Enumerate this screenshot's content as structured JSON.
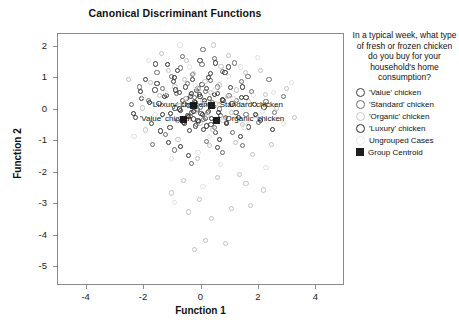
{
  "chart_data": {
    "type": "scatter",
    "title": "Canonical Discriminant Functions",
    "xlabel": "Function 1",
    "ylabel": "Function 2",
    "xlim": [
      -5.0,
      5.0
    ],
    "ylim": [
      -5.6,
      2.4
    ],
    "xticks": [
      -4,
      -2,
      0,
      2,
      4
    ],
    "yticks": [
      2,
      1,
      0,
      -1,
      -2,
      -3,
      -4,
      -5
    ],
    "xtick_labels": [
      "-4",
      "-2",
      "0",
      "2",
      "4"
    ],
    "ytick_labels": [
      "2",
      "1",
      "0",
      "-1",
      "-2",
      "-3",
      "-4",
      "-5"
    ],
    "grid": false,
    "legend_position": "right",
    "legend_title": "In a typical week, what type of fresh or frozen chicken do you buy for your household's home consumption?",
    "series": [
      {
        "name": "'Value' chicken",
        "marker": "open-circle",
        "color": "#3a3a3a",
        "points": [
          [
            -1.62,
            0.62
          ],
          [
            -1.48,
            0.2
          ],
          [
            -1.35,
            -0.15
          ],
          [
            -1.22,
            0.44
          ],
          [
            -1.1,
            -0.58
          ],
          [
            -0.98,
            0.88
          ],
          [
            -0.92,
            0.05
          ],
          [
            -0.85,
            -0.35
          ],
          [
            -0.78,
            0.55
          ],
          [
            -0.72,
            -0.02
          ],
          [
            -0.66,
            0.3
          ],
          [
            -0.6,
            -0.45
          ],
          [
            -0.55,
            0.72
          ],
          [
            -0.5,
            -0.2
          ],
          [
            -0.46,
            0.12
          ],
          [
            -0.42,
            -0.66
          ],
          [
            -0.38,
            0.42
          ],
          [
            -0.34,
            -0.08
          ],
          [
            -0.3,
            0.95
          ],
          [
            -0.27,
            -0.3
          ],
          [
            -0.24,
            0.25
          ],
          [
            -0.2,
            -0.52
          ],
          [
            -0.17,
            0.6
          ],
          [
            -0.14,
            0.0
          ],
          [
            -0.1,
            -0.38
          ],
          [
            -0.06,
            0.48
          ],
          [
            -0.02,
            -0.12
          ],
          [
            0.02,
            0.8
          ],
          [
            0.06,
            -0.62
          ],
          [
            0.1,
            0.18
          ],
          [
            0.14,
            -0.28
          ],
          [
            0.18,
            0.66
          ],
          [
            0.23,
            -0.05
          ],
          [
            0.28,
            0.36
          ],
          [
            0.33,
            -0.48
          ],
          [
            0.4,
            0.1
          ],
          [
            0.48,
            -0.72
          ],
          [
            0.56,
            0.52
          ],
          [
            0.65,
            -0.18
          ],
          [
            0.75,
            0.28
          ],
          [
            0.88,
            -0.4
          ],
          [
            1.02,
            0.7
          ],
          [
            1.2,
            -0.1
          ],
          [
            1.4,
            0.38
          ],
          [
            1.65,
            -0.55
          ],
          [
            -1.95,
            0.95
          ],
          [
            -1.75,
            -0.45
          ],
          [
            -2.1,
            0.35
          ],
          [
            -0.85,
            1.25
          ],
          [
            0.3,
            1.15
          ],
          [
            -1.15,
            -1.05
          ],
          [
            0.55,
            -1.2
          ],
          [
            1.85,
            0.15
          ],
          [
            -2.3,
            -0.25
          ],
          [
            0.95,
            1.35
          ],
          [
            -0.45,
            -1.45
          ],
          [
            1.35,
            -0.85
          ],
          [
            -1.6,
            1.45
          ],
          [
            2.05,
            -0.35
          ],
          [
            -0.05,
            1.55
          ]
        ]
      },
      {
        "name": "'Standard' chicken",
        "marker": "open-circle",
        "color": "#6b6b6b",
        "points": [
          [
            -1.05,
            1.05
          ],
          [
            -0.88,
            0.52
          ],
          [
            -0.72,
            1.32
          ],
          [
            -0.6,
            0.18
          ],
          [
            -0.5,
            0.82
          ],
          [
            -0.4,
            -0.22
          ],
          [
            -0.32,
            1.12
          ],
          [
            -0.25,
            0.38
          ],
          [
            -0.18,
            -0.48
          ],
          [
            -0.12,
            0.68
          ],
          [
            -0.05,
            0.08
          ],
          [
            0.02,
            1.42
          ],
          [
            0.08,
            -0.32
          ],
          [
            0.15,
            0.58
          ],
          [
            0.22,
            -0.08
          ],
          [
            0.3,
            0.92
          ],
          [
            0.38,
            0.22
          ],
          [
            0.46,
            -0.58
          ],
          [
            0.55,
            0.72
          ],
          [
            0.64,
            0.02
          ],
          [
            0.74,
            1.22
          ],
          [
            0.85,
            -0.25
          ],
          [
            0.96,
            0.45
          ],
          [
            1.08,
            -0.72
          ],
          [
            1.22,
            0.3
          ],
          [
            1.38,
            0.88
          ],
          [
            1.55,
            -0.15
          ],
          [
            1.75,
            0.58
          ],
          [
            1.98,
            -0.42
          ],
          [
            2.25,
            0.25
          ],
          [
            -1.35,
            0.68
          ],
          [
            -1.55,
            1.18
          ],
          [
            -1.85,
            0.28
          ],
          [
            -2.15,
            0.72
          ],
          [
            -0.65,
            1.68
          ],
          [
            0.45,
            1.62
          ],
          [
            1.15,
            1.48
          ],
          [
            -1.25,
            -0.78
          ],
          [
            0.18,
            -1.02
          ],
          [
            1.62,
            1.05
          ],
          [
            2.55,
            -0.08
          ],
          [
            -2.45,
            0.15
          ],
          [
            0.72,
            -1.35
          ],
          [
            -0.95,
            -1.28
          ],
          [
            2.85,
            0.42
          ],
          [
            1.42,
            -1.15
          ],
          [
            -1.72,
            -1.12
          ],
          [
            0.05,
            1.92
          ],
          [
            2.35,
            0.95
          ],
          [
            -0.35,
            -1.72
          ]
        ]
      },
      {
        "name": "'Organic' chicken",
        "marker": "open-circle",
        "color": "#c2c2c2",
        "points": [
          [
            -0.92,
            0.72
          ],
          [
            -0.75,
            0.12
          ],
          [
            -0.6,
            0.95
          ],
          [
            -0.48,
            -0.28
          ],
          [
            -0.38,
            0.48
          ],
          [
            -0.28,
            1.15
          ],
          [
            -0.2,
            -0.05
          ],
          [
            -0.12,
            0.65
          ],
          [
            -0.04,
            -0.45
          ],
          [
            0.04,
            0.28
          ],
          [
            0.12,
            0.88
          ],
          [
            0.2,
            -0.18
          ],
          [
            0.3,
            0.55
          ],
          [
            0.4,
            -0.62
          ],
          [
            0.5,
            0.18
          ],
          [
            0.62,
            0.78
          ],
          [
            0.75,
            -0.35
          ],
          [
            0.9,
            0.42
          ],
          [
            1.05,
            -0.08
          ],
          [
            1.22,
            0.62
          ],
          [
            1.42,
            -0.48
          ],
          [
            1.65,
            0.25
          ],
          [
            1.92,
            -0.2
          ],
          [
            2.22,
            0.48
          ],
          [
            2.6,
            0.05
          ],
          [
            -1.15,
            1.25
          ],
          [
            -1.45,
            0.45
          ],
          [
            -1.78,
            0.85
          ],
          [
            -2.05,
            0.05
          ],
          [
            0.68,
            1.38
          ],
          [
            1.52,
            1.18
          ],
          [
            -0.52,
            1.55
          ],
          [
            0.28,
            -1.15
          ],
          [
            -0.82,
            -0.95
          ],
          [
            1.18,
            -1.05
          ],
          [
            2.05,
            1.25
          ],
          [
            -1.95,
            -0.65
          ],
          [
            0.95,
            1.72
          ],
          [
            2.95,
            0.68
          ],
          [
            -0.15,
            -1.55
          ],
          [
            1.78,
            -1.42
          ],
          [
            -1.38,
            1.78
          ],
          [
            3.25,
            -0.25
          ],
          [
            -2.55,
            0.95
          ],
          [
            0.42,
            2.05
          ],
          [
            1.32,
            -2.05
          ],
          [
            -0.62,
            -2.25
          ],
          [
            2.45,
            -1.12
          ],
          [
            -0.08,
            -2.85
          ],
          [
            1.05,
            -3.15
          ],
          [
            0.35,
            -3.45
          ],
          [
            -0.45,
            -3.25
          ],
          [
            1.72,
            -3.05
          ],
          [
            0.15,
            -4.15
          ],
          [
            -0.25,
            -4.45
          ],
          [
            0.85,
            -4.25
          ],
          [
            2.15,
            -2.55
          ],
          [
            -1.05,
            -2.65
          ],
          [
            1.55,
            -2.35
          ],
          [
            0.55,
            -2.15
          ]
        ]
      },
      {
        "name": "'Luxury' chicken",
        "marker": "open-circle",
        "color": "#2a2a2a",
        "points": [
          [
            -1.28,
            0.42
          ],
          [
            -1.08,
            -0.12
          ],
          [
            -0.9,
            0.62
          ],
          [
            -0.76,
            0.02
          ],
          [
            -0.64,
            -0.42
          ],
          [
            -0.54,
            0.35
          ],
          [
            -0.45,
            -0.22
          ],
          [
            -0.36,
            0.52
          ],
          [
            -0.28,
            -0.05
          ],
          [
            -0.2,
            0.22
          ],
          [
            -0.12,
            -0.35
          ],
          [
            -0.05,
            0.42
          ],
          [
            0.03,
            -0.15
          ],
          [
            0.1,
            0.28
          ],
          [
            0.18,
            -0.52
          ],
          [
            0.27,
            0.15
          ],
          [
            0.36,
            -0.28
          ],
          [
            0.46,
            0.48
          ],
          [
            0.58,
            -0.08
          ],
          [
            0.72,
            0.32
          ],
          [
            0.88,
            -0.45
          ],
          [
            1.06,
            0.18
          ],
          [
            1.28,
            -0.25
          ],
          [
            1.55,
            0.38
          ],
          [
            1.88,
            -0.15
          ],
          [
            -1.55,
            0.82
          ],
          [
            -1.82,
            0.22
          ],
          [
            -2.12,
            0.58
          ],
          [
            -0.95,
            1.02
          ],
          [
            0.25,
            1.02
          ],
          [
            -1.42,
            -0.68
          ],
          [
            0.62,
            -0.95
          ],
          [
            1.42,
            0.72
          ],
          [
            -2.38,
            -0.12
          ],
          [
            0.82,
            1.18
          ],
          [
            -0.72,
            -1.18
          ],
          [
            2.18,
            0.08
          ],
          [
            -1.18,
            1.42
          ],
          [
            2.48,
            -0.62
          ],
          [
            0.48,
            1.48
          ]
        ]
      },
      {
        "name": "Ungrouped Cases",
        "marker": "open-circle",
        "color": "#e0e0e0",
        "points": [
          [
            -0.55,
            0.35
          ],
          [
            -0.22,
            0.75
          ],
          [
            0.12,
            0.15
          ],
          [
            0.45,
            0.62
          ],
          [
            0.78,
            -0.25
          ],
          [
            1.12,
            0.35
          ],
          [
            -0.88,
            -0.35
          ],
          [
            -1.25,
            0.55
          ],
          [
            1.48,
            -0.55
          ],
          [
            1.82,
            0.45
          ],
          [
            -1.62,
            -0.15
          ],
          [
            0.28,
            -0.85
          ],
          [
            2.12,
            -0.05
          ],
          [
            -2.02,
            0.42
          ],
          [
            0.95,
            1.05
          ],
          [
            -0.42,
            1.35
          ],
          [
            2.52,
            0.55
          ],
          [
            -0.12,
            -1.35
          ],
          [
            1.35,
            1.35
          ],
          [
            -1.05,
            -1.55
          ],
          [
            2.85,
            -0.45
          ],
          [
            0.65,
            -1.75
          ],
          [
            -2.35,
            -0.85
          ],
          [
            1.95,
            1.65
          ],
          [
            -0.75,
            2.05
          ],
          [
            3.15,
            0.85
          ],
          [
            -1.85,
            1.55
          ],
          [
            0.05,
            -2.45
          ],
          [
            2.25,
            -1.85
          ],
          [
            -0.95,
            -2.95
          ]
        ]
      }
    ],
    "centroids": [
      {
        "label": "'Value' chicken",
        "x": -0.62,
        "y": -0.32,
        "label_x": -2.15,
        "label_y": -0.3
      },
      {
        "label": "'Luxury' chicken",
        "x": -0.28,
        "y": 0.12,
        "label_x": -1.75,
        "label_y": 0.16
      },
      {
        "label": "'Standard' chicken",
        "x": 0.35,
        "y": 0.12,
        "label_x": 0.58,
        "label_y": 0.16
      },
      {
        "label": "'Organic' chicken",
        "x": 0.52,
        "y": -0.34,
        "label_x": 0.78,
        "label_y": -0.3
      }
    ],
    "legend_entries": [
      {
        "label": "'Value' chicken",
        "marker": "open-circle",
        "color": "#3a3a3a"
      },
      {
        "label": "'Standard' chicken",
        "marker": "open-circle",
        "color": "#6b6b6b"
      },
      {
        "label": "'Organic' chicken",
        "marker": "open-circle",
        "color": "#c8c8c8"
      },
      {
        "label": "'Luxury' chicken",
        "marker": "open-circle",
        "color": "#2a2a2a"
      },
      {
        "label": "Ungrouped Cases",
        "marker": "open-circle",
        "color": "#e6e6e6"
      },
      {
        "label": "Group Centroid",
        "marker": "filled-square",
        "color": "#1d1d1d"
      }
    ]
  }
}
